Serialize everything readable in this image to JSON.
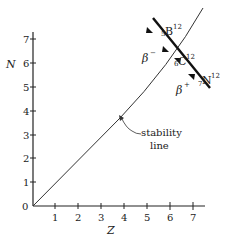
{
  "axes": {
    "x_label": "Z",
    "y_label": "N",
    "x_ticks": [
      "1",
      "2",
      "3",
      "4",
      "5",
      "6",
      "7"
    ],
    "y_ticks": [
      "1",
      "2",
      "3",
      "4",
      "5",
      "6",
      "7"
    ],
    "origin_label": "0"
  },
  "annotations": {
    "stability_line_label_1": "stability",
    "stability_line_label_2": "line",
    "beta_minus": "β",
    "beta_minus_sign": "−",
    "beta_plus": "β",
    "beta_plus_sign": "+"
  },
  "nuclides": [
    {
      "z_sub": "5",
      "symbol": "B",
      "a_sup": "12"
    },
    {
      "z_sub": "6",
      "symbol": "C",
      "a_sup": "12"
    },
    {
      "z_sub": "7",
      "symbol": "N",
      "a_sup": "12"
    }
  ]
}
